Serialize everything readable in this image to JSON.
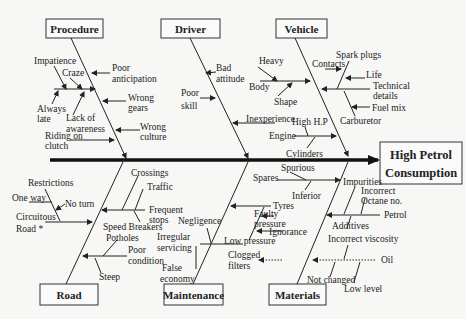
{
  "diagram": {
    "type": "fishbone",
    "effect": {
      "line1": "High Petrol",
      "line2": "Consumption"
    },
    "categories": {
      "procedure": {
        "label": "Procedure",
        "causes": [
          "Impatience",
          "Craze",
          "Always late",
          "Lack of awareness",
          "Poor anticipation",
          "Wrong gears",
          "Wrong culture",
          "Riding on clutch"
        ]
      },
      "driver": {
        "label": "Driver",
        "causes": [
          "Bad attitude",
          "Poor skill",
          "Inexperience"
        ]
      },
      "vehicle": {
        "label": "Vehicle",
        "causes": [
          "Heavy",
          "Body",
          "Shape",
          "Spark plugs",
          "Contacts",
          "Life",
          "Technical details",
          "Fuel mix",
          "Carburetor",
          "High H.P",
          "Engine",
          "Cylinders"
        ]
      },
      "road": {
        "label": "Road",
        "causes": [
          "Restrictions",
          "One way",
          "No turn",
          "Circuitous Road *",
          "Crossings",
          "Traffic",
          "Frequent stops",
          "Speed Breakers",
          "Potholes",
          "Poor condition",
          "Steep"
        ]
      },
      "maintenance": {
        "label": "Maintenance",
        "causes": [
          "Negligence",
          "Irregular servicing",
          "False economy",
          "Tyres",
          "Faulty pressure",
          "Ignorance",
          "Low pressure",
          "Clogged filters"
        ]
      },
      "materials": {
        "label": "Materials",
        "causes": [
          "Spares",
          "Spurious",
          "Inferior",
          "Impurities",
          "Incorrect Octane no.",
          "Petrol",
          "Additives",
          "Incorrect viscosity",
          "Oil",
          "Not changed",
          "Low level"
        ]
      }
    },
    "labels": {
      "impatience": "Impatience",
      "craze": "Craze",
      "poor_anticipation_1": "Poor",
      "poor_anticipation_2": "anticipation",
      "always_late_1": "Always",
      "always_late_2": "late",
      "lack_awareness_1": "Lack of",
      "lack_awareness_2": "awareness",
      "wrong_gears_1": "Wrong",
      "wrong_gears_2": "gears",
      "wrong_culture_1": "Wrong",
      "wrong_culture_2": "culture",
      "riding_1": "Riding on",
      "riding_2": "clutch",
      "bad_attitude_1": "Bad",
      "bad_attitude_2": "attitude",
      "poor_skill_1": "Poor",
      "poor_skill_2": "skill",
      "inexperience": "Inexperience",
      "heavy": "Heavy",
      "body": "Body",
      "shape": "Shape",
      "spark_plugs": "Spark plugs",
      "contacts": "Contacts",
      "life": "Life",
      "technical_1": "Technical",
      "technical_2": "details",
      "fuel_mix": "Fuel mix",
      "carburetor": "Carburetor",
      "high_hp": "High H.P",
      "engine": "Engine",
      "cylinders": "Cylinders",
      "restrictions": "Restrictions",
      "one_way": "One way",
      "no_turn": "No turn",
      "circuitous_1": "Circuitous",
      "circuitous_2": "Road *",
      "crossings": "Crossings",
      "traffic": "Traffic",
      "frequent_1": "Frequent",
      "frequent_2": "stops",
      "speed_breakers": "Speed Breakers",
      "potholes": "Potholes",
      "poor_condition_1": "Poor",
      "poor_condition_2": "condition",
      "steep": "Steep",
      "negligence": "Negligence",
      "irregular_1": "Irregular",
      "irregular_2": "servicing",
      "false_1": "False",
      "false_2": "economy",
      "tyres": "Tyres",
      "faulty_1": "Faulty",
      "faulty_2": "pressure",
      "ignorance": "Ignorance",
      "low_pressure": "Low pressure",
      "clogged_1": "Clogged",
      "clogged_2": "filters",
      "spares": "Spares",
      "spurious": "Spurious",
      "inferior": "Inferior",
      "impurities": "Impurities",
      "incorrect_1": "Incorrect",
      "incorrect_2": "Octane no.",
      "petrol": "Petrol",
      "additives": "Additives",
      "viscosity": "Incorrect viscosity",
      "oil": "Oil",
      "not_changed": "Not changed",
      "low_level": "Low level"
    }
  }
}
